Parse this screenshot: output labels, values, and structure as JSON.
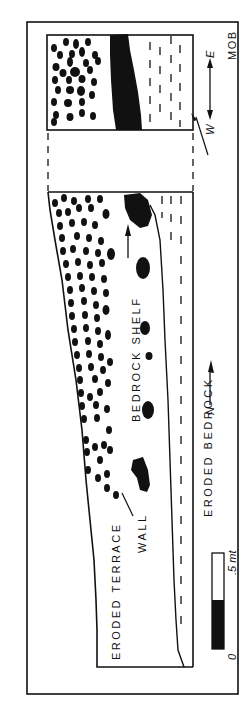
{
  "figure": {
    "author_mark": "MOB",
    "labels": {
      "eroded_bedrock": "ERODED BEDROCK",
      "bedrock_shelf": "BEDROCK SHELF",
      "eroded_terrace": "ERODED TERRACE",
      "wall": "WALL"
    },
    "orientation": {
      "west": "W",
      "east": "E",
      "north": "N"
    },
    "scale_bar": {
      "zero_label": "0",
      "end_label": ".5 mt"
    },
    "colors": {
      "ink": "#111111",
      "paper": "#ffffff"
    }
  }
}
